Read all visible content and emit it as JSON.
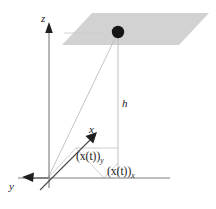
{
  "figure": {
    "background_color": "#ffffff",
    "plane_fill": "#d2d2d2",
    "line_color": "#b5b5b5",
    "axis_color": "#2b2b2b",
    "dot_color": "#151515"
  },
  "axes": {
    "z_label": "z",
    "x_label": "x",
    "y_label": "y"
  },
  "annotations": {
    "height_label": "h",
    "projection_y": {
      "base": "(x(t))",
      "subscript": "y"
    },
    "projection_x": {
      "base": "(x(t))",
      "subscript": "x"
    }
  },
  "elements": {
    "plane_name": "horizontal-plane",
    "point_name": "moving-point",
    "height_line_name": "height-drop-line"
  }
}
